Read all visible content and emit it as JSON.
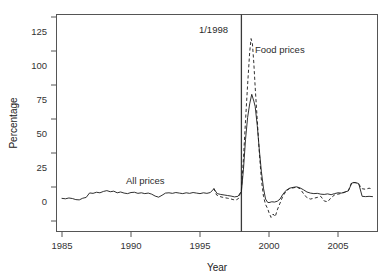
{
  "figure": {
    "background_color": "#ffffff",
    "line_color": "#1a1a1a",
    "frame_color": "#555555"
  },
  "axes": {
    "ylabel": "Percentage",
    "xlabel": "Year",
    "yticks": [
      "0",
      "25",
      "50",
      "75",
      "100",
      "125"
    ],
    "xticks": [
      "1985",
      "1990",
      "1995",
      "2000",
      "2005"
    ]
  },
  "annotations": {
    "event_label": "1/1998",
    "food_label": "Food prices",
    "all_label": "All prices"
  },
  "chart_data": {
    "type": "line",
    "title": "",
    "xlabel": "Year",
    "ylabel": "Percentage",
    "xlim": [
      1984.6,
      11908.0
    ],
    "ylim": [
      -15,
      128
    ],
    "xtick_values": [
      1985,
      1990,
      1995,
      2000,
      2005
    ],
    "ytick_values": [
      0,
      25,
      50,
      75,
      100,
      125
    ],
    "grid": false,
    "legend": "inline annotations",
    "event_line": {
      "x": 1998.0,
      "label": "1/1998"
    },
    "series": [
      {
        "name": "All prices",
        "style": "solid",
        "x": [
          1985.0,
          1985.25,
          1985.5,
          1985.75,
          1986.0,
          1986.25,
          1986.5,
          1986.75,
          1987.0,
          1987.25,
          1987.5,
          1987.75,
          1988.0,
          1988.25,
          1988.5,
          1988.75,
          1989.0,
          1989.25,
          1989.5,
          1989.75,
          1990.0,
          1990.25,
          1990.5,
          1990.75,
          1991.0,
          1991.25,
          1991.5,
          1991.75,
          1992.0,
          1992.25,
          1992.5,
          1992.75,
          1993.0,
          1993.25,
          1993.5,
          1993.75,
          1994.0,
          1994.25,
          1994.5,
          1994.75,
          1995.0,
          1995.25,
          1995.5,
          1995.75,
          1996.0,
          1996.25,
          1996.5,
          1996.75,
          1997.0,
          1997.25,
          1997.5,
          1997.75,
          1998.0,
          1998.15,
          1998.3,
          1998.45,
          1998.6,
          1998.75,
          1998.9,
          1999.0,
          1999.15,
          1999.3,
          1999.45,
          1999.6,
          1999.75,
          1999.9,
          2000.0,
          2000.2,
          2000.4,
          2000.6,
          2000.8,
          2001.0,
          2001.25,
          2001.5,
          2001.75,
          2002.0,
          2002.25,
          2002.5,
          2002.75,
          2003.0,
          2003.25,
          2003.5,
          2003.75,
          2004.0,
          2004.25,
          2004.5,
          2004.75,
          2005.0,
          2005.25,
          2005.5,
          2005.75,
          2006.0,
          2006.25,
          2006.5,
          2006.75,
          2007.0,
          2007.25,
          2007.5
        ],
        "y": [
          4.5,
          4.2,
          4.8,
          4.4,
          3.6,
          3.4,
          4.6,
          5.2,
          8.5,
          8.2,
          9.0,
          8.6,
          9.6,
          10.2,
          9.4,
          9.8,
          8.6,
          9.2,
          8.4,
          8.0,
          8.8,
          9.0,
          8.2,
          8.6,
          8.0,
          8.4,
          7.6,
          6.2,
          5.4,
          6.8,
          8.4,
          8.6,
          8.2,
          8.8,
          8.4,
          8.0,
          8.6,
          8.2,
          8.8,
          8.4,
          8.0,
          8.6,
          8.2,
          8.8,
          11.5,
          8.0,
          7.4,
          7.0,
          6.6,
          6.2,
          5.6,
          6.0,
          9.5,
          26.0,
          48.0,
          64.0,
          74.0,
          81.0,
          76.0,
          72.0,
          58.0,
          40.0,
          24.0,
          12.0,
          4.0,
          1.6,
          1.4,
          2.0,
          1.8,
          2.4,
          4.0,
          7.5,
          10.5,
          12.0,
          12.6,
          13.0,
          12.2,
          10.8,
          9.2,
          8.4,
          8.0,
          8.2,
          7.6,
          7.4,
          7.8,
          7.2,
          8.0,
          8.6,
          8.4,
          9.2,
          10.0,
          15.8,
          16.2,
          15.4,
          6.0,
          5.8,
          6.0,
          5.8
        ]
      },
      {
        "name": "Food prices",
        "style": "dashed",
        "x": [
          1996.0,
          1996.2,
          1996.4,
          1996.6,
          1996.8,
          1997.0,
          1997.2,
          1997.4,
          1997.6,
          1997.8,
          1998.0,
          1998.15,
          1998.3,
          1998.45,
          1998.6,
          1998.7,
          1998.8,
          1998.9,
          1999.0,
          1999.15,
          1999.3,
          1999.45,
          1999.6,
          1999.75,
          1999.9,
          2000.0,
          2000.15,
          2000.3,
          2000.45,
          2000.6,
          2000.8,
          2001.0,
          2001.25,
          2001.5,
          2001.75,
          2002.0,
          2002.25,
          2002.5,
          2002.75,
          2003.0,
          2003.25,
          2003.5,
          2003.75,
          2004.0,
          2004.25,
          2004.5,
          2004.75,
          2005.0,
          2005.25,
          2005.5,
          2005.75,
          2006.0,
          2006.25,
          2006.5,
          2006.75,
          2007.0,
          2007.25,
          2007.5
        ],
        "y": [
          12.0,
          7.0,
          6.0,
          5.4,
          5.0,
          4.6,
          4.2,
          3.6,
          3.2,
          4.5,
          11.0,
          34.0,
          62.0,
          88.0,
          112.0,
          122.0,
          118.0,
          104.0,
          86.0,
          62.0,
          38.0,
          18.0,
          6.0,
          0.0,
          -3.0,
          -6.0,
          -9.5,
          -7.0,
          -9.0,
          -4.0,
          1.0,
          6.0,
          10.0,
          11.8,
          12.2,
          12.8,
          11.6,
          8.0,
          5.0,
          4.0,
          4.6,
          5.2,
          6.0,
          2.6,
          2.0,
          5.0,
          7.0,
          7.6,
          8.2,
          9.0,
          10.2,
          16.4,
          16.0,
          15.0,
          11.6,
          11.2,
          12.0,
          11.4
        ]
      }
    ]
  }
}
